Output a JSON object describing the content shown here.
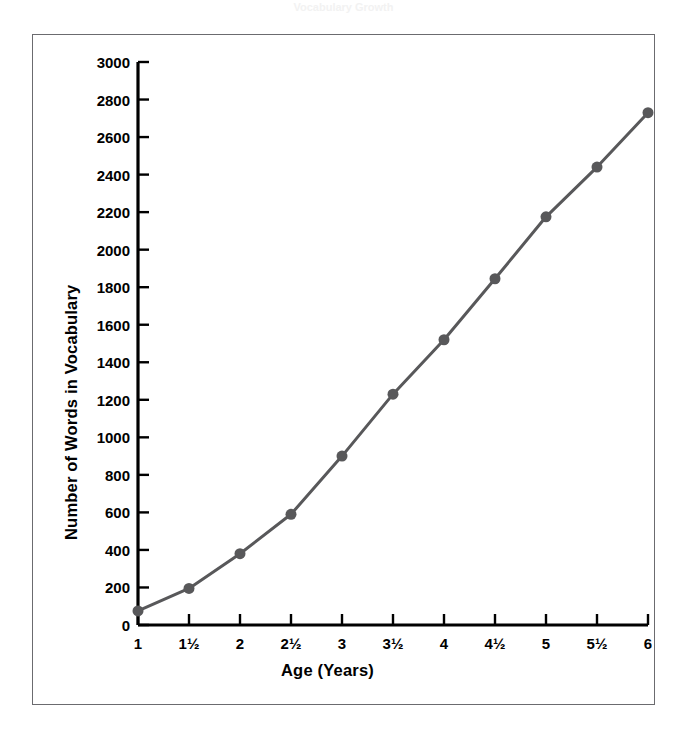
{
  "figure": {
    "cropped_title_fragment": "Vocabulary Growth",
    "background_color": "#ffffff",
    "frame_color": "#6b6b6f",
    "axis_color": "#000000",
    "series_color": "#58585a"
  },
  "chart_data": {
    "type": "line",
    "title": "",
    "xlabel": "Age (Years)",
    "ylabel": "Number of Words in Vocabulary",
    "categories": [
      "1",
      "1½",
      "2",
      "2½",
      "3",
      "3½",
      "4",
      "4½",
      "5",
      "5½",
      "6"
    ],
    "x": [
      1,
      1.5,
      2,
      2.5,
      3,
      3.5,
      4,
      4.5,
      5,
      5.5,
      6
    ],
    "values": [
      75,
      195,
      380,
      590,
      900,
      1230,
      1520,
      1845,
      2175,
      2440,
      2730
    ],
    "series": [
      {
        "name": "Number of Words in Vocabulary",
        "values": [
          75,
          195,
          380,
          590,
          900,
          1230,
          1520,
          1845,
          2175,
          2440,
          2730
        ]
      }
    ],
    "xlim": [
      1,
      6
    ],
    "ylim": [
      0,
      3000
    ],
    "ytick_values": [
      0,
      200,
      400,
      600,
      800,
      1000,
      1200,
      1400,
      1600,
      1800,
      2000,
      2200,
      2400,
      2600,
      2800,
      3000
    ],
    "ytick_labels": [
      "0",
      "200",
      "400",
      "600",
      "800",
      "1000",
      "1200",
      "1400",
      "1600",
      "1800",
      "2000",
      "2200",
      "2400",
      "2600",
      "2800",
      "3000"
    ],
    "xtick_values": [
      1,
      1.5,
      2,
      2.5,
      3,
      3.5,
      4,
      4.5,
      5,
      5.5,
      6
    ],
    "xtick_labels": [
      "1",
      "1½",
      "2",
      "2½",
      "3",
      "3½",
      "4",
      "4½",
      "5",
      "5½",
      "6"
    ],
    "grid": false,
    "legend": null,
    "legend_position": "none",
    "marker": "circle",
    "marker_size": 11,
    "line_width": 3
  }
}
